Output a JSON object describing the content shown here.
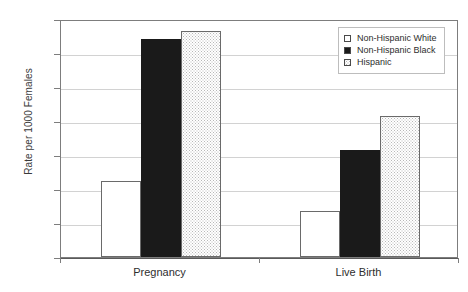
{
  "chart_data": {
    "type": "bar",
    "title": "",
    "xlabel": "",
    "ylabel": "Rate per 1000 Females",
    "ylim": [
      0,
      140
    ],
    "yticks": [
      0,
      20,
      40,
      60,
      80,
      100,
      120,
      140
    ],
    "ytick_labels": [
      "0",
      "20",
      "40",
      "60",
      "80",
      "100",
      "120",
      "140"
    ],
    "grid": true,
    "legend_position": "top-right",
    "categories": [
      "Pregnancy",
      "Live Birth"
    ],
    "series": [
      {
        "name": "Non-Hispanic White",
        "fill": "hollow-white",
        "color": "#ffffff",
        "values": [
          45,
          27
        ]
      },
      {
        "name": "Non-Hispanic Black",
        "fill": "solid-black",
        "color": "#1a1a1a",
        "values": [
          128,
          63
        ]
      },
      {
        "name": "Hispanic",
        "fill": "stippled",
        "color": "#f2f2f2",
        "values": [
          133,
          83
        ]
      }
    ]
  },
  "legend": {
    "items": [
      {
        "label": "Non-Hispanic White",
        "marker": "hollow-square-icon"
      },
      {
        "label": "Non-Hispanic Black",
        "marker": "filled-square-icon"
      },
      {
        "label": "Hispanic",
        "marker": "dotted-square-icon"
      }
    ]
  }
}
